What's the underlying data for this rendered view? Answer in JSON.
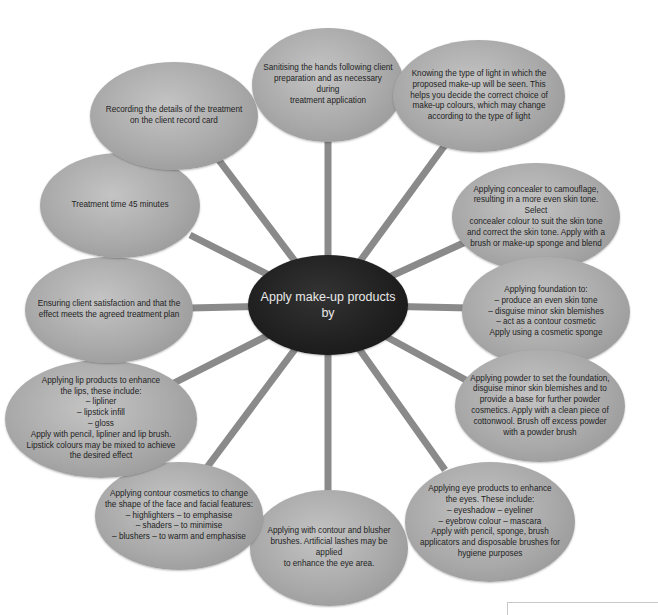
{
  "diagram": {
    "center": {
      "label": "Apply make-up products\nby"
    },
    "nodes": [
      {
        "id": "sanitising",
        "label": "Sanitising the hands following client\npreparation and as necessary during\ntreatment application"
      },
      {
        "id": "light",
        "label": "Knowing the type of light in which the\nproposed make-up will be seen. This\nhelps you decide the correct choice of\nmake-up colours, which may change\naccording to the type of light"
      },
      {
        "id": "concealer",
        "label": "Applying concealer to camouflage,\nresulting in a more even skin tone. Select\nconcealer colour to suit the skin tone\nand correct the skin tone. Apply with a\nbrush or make-up sponge and blend"
      },
      {
        "id": "foundation",
        "label": "Applying foundation to:\n– produce an even skin tone\n– disguise minor skin blemishes\n– act as a contour cosmetic\nApply using a cosmetic sponge"
      },
      {
        "id": "powder",
        "label": "Applying powder to set the foundation,\ndisguise minor skin blemishes and to\nprovide a base for further powder\ncosmetics. Apply with a clean piece of\ncottonwool. Brush off excess powder\nwith a powder brush"
      },
      {
        "id": "eyes",
        "label": "Applying eye products to enhance\nthe eyes. These include:\n– eyeshadow          – eyeliner\n– eyebrow colour   – mascara\nApply with pencil, sponge, brush\napplicators and disposable brushes for\nhygiene purposes"
      },
      {
        "id": "brushes",
        "label": "Applying with contour and blusher\nbrushes. Artificial lashes may be applied\nto enhance the eye area."
      },
      {
        "id": "contour",
        "label": "Applying contour cosmetics to change\nthe shape of the face and facial features:\n– highlighters – to emphasise\n– shaders – to minimise\n– blushers – to warm and emphasise"
      },
      {
        "id": "lips",
        "label": "Applying lip products to enhance\nthe lips, these include:\n– lipliner\n– lipstick infill\n– gloss\nApply with pencil, lipliner and lip brush.\nLipstick colours may be mixed to achieve\nthe desired effect"
      },
      {
        "id": "satisfaction",
        "label": "Ensuring client satisfaction and that the\neffect meets the agreed treatment plan"
      },
      {
        "id": "time",
        "label": "Treatment time 45 minutes"
      },
      {
        "id": "recording",
        "label": "Recording the details of the treatment\non the client record card"
      }
    ]
  },
  "colors": {
    "background": "#ffffff",
    "node_fill": "#a9a9a9",
    "center_fill": "#1f1f1f",
    "center_text": "#e9e9e9",
    "node_text": "#1e1e1e",
    "spoke": "#8a8a8a"
  }
}
